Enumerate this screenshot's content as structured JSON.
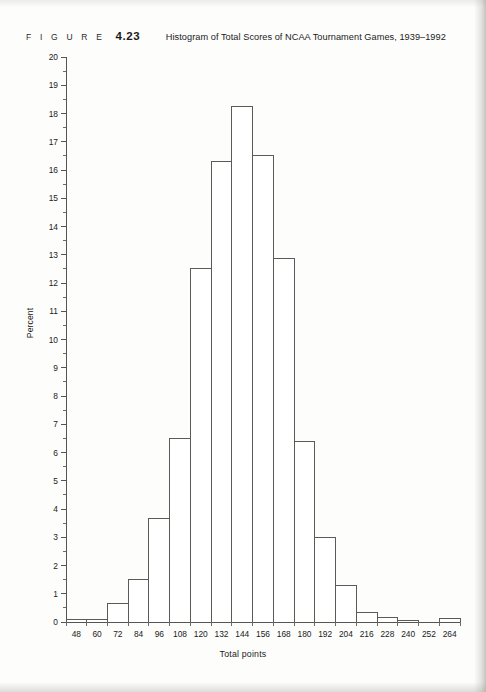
{
  "figure": {
    "label_word": "F I G U R E",
    "number": "4.23",
    "title": "Histogram of Total Scores of NCAA Tournament Games, 1939–1992"
  },
  "page": {
    "bleed_text_line1": " ",
    "bleed_text_line2": " "
  },
  "chart_data": {
    "type": "bar",
    "title": "Histogram of Total Scores of NCAA Tournament Games, 1939–1992",
    "xlabel": "Total points",
    "ylabel": "Percent",
    "xlim": [
      42,
      270
    ],
    "ylim": [
      0,
      20
    ],
    "grid": false,
    "legend": null,
    "bin_width": 12,
    "xtick_labels": [
      "48",
      "60",
      "72",
      "84",
      "96",
      "108",
      "120",
      "132",
      "144",
      "156",
      "168",
      "180",
      "192",
      "204",
      "216",
      "228",
      "240",
      "252",
      "264"
    ],
    "xticks": [
      48,
      60,
      72,
      84,
      96,
      108,
      120,
      132,
      144,
      156,
      168,
      180,
      192,
      204,
      216,
      228,
      240,
      252,
      264
    ],
    "ytick_labels": [
      "0",
      "1",
      "2",
      "3",
      "4",
      "5",
      "6",
      "7",
      "8",
      "9",
      "10",
      "11",
      "12",
      "13",
      "14",
      "15",
      "16",
      "17",
      "18",
      "19",
      "20"
    ],
    "yticks": [
      0,
      1,
      2,
      3,
      4,
      5,
      6,
      7,
      8,
      9,
      10,
      11,
      12,
      13,
      14,
      15,
      16,
      17,
      18,
      19,
      20
    ],
    "yminor_step": 0.5,
    "bin_edges": [
      42,
      54,
      66,
      78,
      90,
      102,
      114,
      126,
      138,
      150,
      162,
      174,
      186,
      198,
      210,
      222,
      234,
      246,
      258,
      270
    ],
    "bins": [
      {
        "left": 42,
        "right": 54,
        "center": 48,
        "value": 0.1
      },
      {
        "left": 54,
        "right": 66,
        "center": 60,
        "value": 0.1
      },
      {
        "left": 66,
        "right": 78,
        "center": 72,
        "value": 0.65
      },
      {
        "left": 78,
        "right": 90,
        "center": 84,
        "value": 1.5
      },
      {
        "left": 90,
        "right": 102,
        "center": 96,
        "value": 3.65
      },
      {
        "left": 102,
        "right": 114,
        "center": 108,
        "value": 6.5
      },
      {
        "left": 114,
        "right": 126,
        "center": 120,
        "value": 12.5
      },
      {
        "left": 126,
        "right": 138,
        "center": 132,
        "value": 16.3
      },
      {
        "left": 138,
        "right": 150,
        "center": 144,
        "value": 18.25
      },
      {
        "left": 150,
        "right": 162,
        "center": 156,
        "value": 16.5
      },
      {
        "left": 162,
        "right": 174,
        "center": 168,
        "value": 12.85
      },
      {
        "left": 174,
        "right": 186,
        "center": 180,
        "value": 6.4
      },
      {
        "left": 186,
        "right": 198,
        "center": 192,
        "value": 3.0
      },
      {
        "left": 198,
        "right": 210,
        "center": 204,
        "value": 1.3
      },
      {
        "left": 210,
        "right": 222,
        "center": 216,
        "value": 0.35
      },
      {
        "left": 222,
        "right": 234,
        "center": 228,
        "value": 0.15
      },
      {
        "left": 234,
        "right": 246,
        "center": 240,
        "value": 0.05
      },
      {
        "left": 246,
        "right": 258,
        "center": 252,
        "value": 0.0
      },
      {
        "left": 258,
        "right": 270,
        "center": 264,
        "value": 0.12
      }
    ],
    "values": [
      0.1,
      0.1,
      0.65,
      1.5,
      3.65,
      6.5,
      12.5,
      16.3,
      18.25,
      16.5,
      12.85,
      6.4,
      3.0,
      1.3,
      0.35,
      0.15,
      0.05,
      0.0,
      0.12
    ],
    "categories": [
      "48",
      "60",
      "72",
      "84",
      "96",
      "108",
      "120",
      "132",
      "144",
      "156",
      "168",
      "180",
      "192",
      "204",
      "216",
      "228",
      "240",
      "252",
      "264"
    ]
  },
  "geometry": {
    "plot_left": 66,
    "plot_right": 460,
    "baseline_y": 622,
    "top_y": 57,
    "px_per_unit": 28.25,
    "px_per_point": 1.7281
  }
}
